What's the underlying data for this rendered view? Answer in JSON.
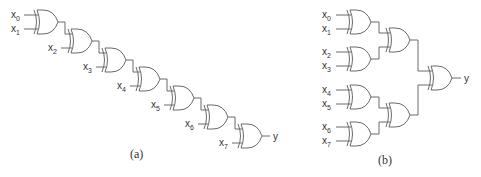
{
  "figure": {
    "panel_a": {
      "caption": "(a)",
      "description": "Linear chain of 7 XOR gates",
      "inputs": [
        {
          "base": "x",
          "sub": "0"
        },
        {
          "base": "x",
          "sub": "1"
        },
        {
          "base": "x",
          "sub": "2"
        },
        {
          "base": "x",
          "sub": "3"
        },
        {
          "base": "x",
          "sub": "4"
        },
        {
          "base": "x",
          "sub": "5"
        },
        {
          "base": "x",
          "sub": "6"
        },
        {
          "base": "x",
          "sub": "7"
        }
      ],
      "output": "y"
    },
    "panel_b": {
      "caption": "(b)",
      "description": "Balanced tree of 7 XOR gates",
      "inputs": [
        {
          "base": "x",
          "sub": "0"
        },
        {
          "base": "x",
          "sub": "1"
        },
        {
          "base": "x",
          "sub": "2"
        },
        {
          "base": "x",
          "sub": "3"
        },
        {
          "base": "x",
          "sub": "4"
        },
        {
          "base": "x",
          "sub": "5"
        },
        {
          "base": "x",
          "sub": "6"
        },
        {
          "base": "x",
          "sub": "7"
        }
      ],
      "output": "y"
    },
    "gate_type": "xor-gate-icon",
    "line_color": "#6a6a6a"
  }
}
